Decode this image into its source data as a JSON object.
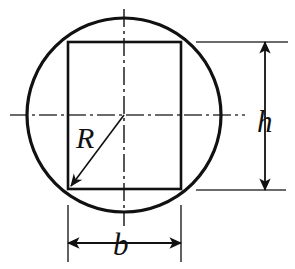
{
  "figure": {
    "kind": "engineering-cross-section-diagram",
    "background_color": "#ffffff",
    "line_color": "#111111",
    "centerline_color": "#333333"
  },
  "shapes": {
    "circle": {
      "name": "outer-circle",
      "center_x": 124,
      "center_y": 115,
      "radius": 97,
      "stroke_width": 3.2
    },
    "rectangle": {
      "name": "inscribed-rectangle",
      "left": 68,
      "top": 42,
      "right": 181,
      "bottom": 189,
      "width": 113,
      "height": 147,
      "stroke_width": 2.6
    }
  },
  "centerlines": {
    "horizontal": {
      "name": "horizontal-centerline",
      "x1": 10,
      "x2": 245,
      "y": 115,
      "dash": "18,4,3,4"
    },
    "vertical": {
      "name": "vertical-centerline",
      "y1": 9,
      "y2": 226,
      "x": 124,
      "dash": "18,4,3,4"
    }
  },
  "radius_callout": {
    "label": "R",
    "label_x": 76,
    "label_y": 148,
    "font_size": 30,
    "from_x": 124,
    "from_y": 115,
    "to_x": 71,
    "to_y": 186,
    "stroke_width": 1.6
  },
  "height_dimension": {
    "label": "h",
    "label_x": 257,
    "label_y": 132,
    "font_size": 31,
    "line_x": 265,
    "top_y": 42,
    "bottom_y": 190,
    "stroke_width": 1.8,
    "extension_top": {
      "x1": 196,
      "x2": 288,
      "y": 42
    },
    "extension_bottom": {
      "x1": 196,
      "x2": 286,
      "y": 190
    }
  },
  "width_dimension": {
    "label": "b",
    "label_x": 113,
    "label_y": 255,
    "font_size": 31,
    "line_y": 243,
    "left_x": 68,
    "right_x": 181,
    "stroke_width": 1.8,
    "extension_left": {
      "x": 68,
      "y1": 205,
      "y2": 262
    },
    "extension_right": {
      "x": 181,
      "y1": 205,
      "y2": 262
    }
  }
}
